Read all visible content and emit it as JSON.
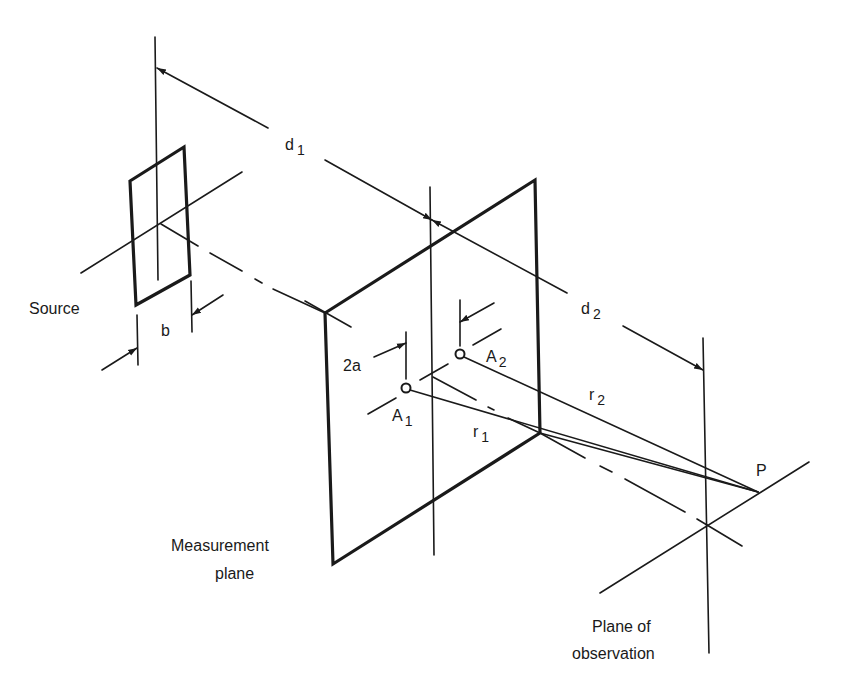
{
  "diagram": {
    "colors": {
      "line": "#1a1a1a",
      "background": "#ffffff"
    },
    "labels": {
      "source": "Source",
      "source_width": "b",
      "d1": "d",
      "d1_sub": "1",
      "d2": "d",
      "d2_sub": "2",
      "aperture_spacing": "2a",
      "a1": "A",
      "a1_sub": "1",
      "a2": "A",
      "a2_sub": "2",
      "r1": "r",
      "r1_sub": "1",
      "r2": "r",
      "r2_sub": "2",
      "point": "P",
      "measurement_line1": "Measurement",
      "measurement_line2": "plane",
      "observation_line1": "Plane of",
      "observation_line2": "observation"
    }
  }
}
